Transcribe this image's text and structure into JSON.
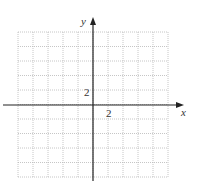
{
  "chart_data": {
    "type": "line",
    "title": "",
    "xlabel": "x",
    "ylabel": "y",
    "x_tick_labels": [
      {
        "value": 2,
        "label": "2"
      }
    ],
    "y_tick_labels": [
      {
        "value": 2,
        "label": "2"
      }
    ],
    "xlim": [
      -10,
      10
    ],
    "ylim": [
      -10,
      10
    ],
    "grid_step": 2,
    "grid": true,
    "grid_style": "dotted",
    "series": []
  },
  "axes": {
    "x_label": "x",
    "y_label": "y",
    "x_tick": "2",
    "y_tick": "2"
  },
  "colors": {
    "axis": "#222222",
    "grid": "#b8b8b8",
    "text": "#333333"
  }
}
